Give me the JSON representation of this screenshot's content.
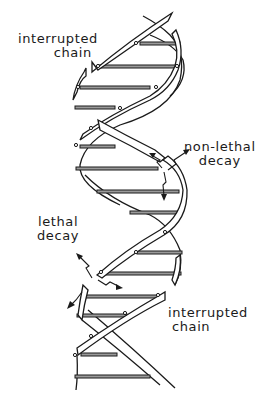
{
  "diagram": {
    "labels": {
      "top_interrupted": {
        "line1": "interrupted",
        "line2": "chain"
      },
      "non_lethal": {
        "line1": "non-lethal",
        "line2": "decay"
      },
      "lethal": {
        "line1": "lethal",
        "line2": "decay"
      },
      "bottom_interrupted": {
        "line1": "interrupted",
        "line2": "chain"
      }
    },
    "colors": {
      "ink": "#1a1a1a",
      "rung_fill": "#9a9a9a",
      "background": "#ffffff"
    },
    "rungs_count": 13
  }
}
